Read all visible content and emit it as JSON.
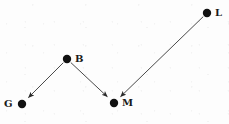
{
  "diagram": {
    "type": "directed-graph",
    "title": "",
    "canvas": {
      "width": 229,
      "height": 124
    },
    "colors": {
      "background": "#fdfdfd",
      "node_fill": "#111111",
      "edge_stroke": "#4a4a4a",
      "label_color": "#1a1a1a"
    },
    "nodes": [
      {
        "id": "B",
        "label": "B",
        "x": 67,
        "y": 59,
        "r": 4.2,
        "label_x": 75,
        "label_y": 54,
        "label_side": "right"
      },
      {
        "id": "G",
        "label": "G",
        "x": 22,
        "y": 104,
        "r": 4.2,
        "label_x": 4,
        "label_y": 99,
        "label_side": "left"
      },
      {
        "id": "M",
        "label": "M",
        "x": 114,
        "y": 103,
        "r": 4.2,
        "label_x": 122,
        "label_y": 98,
        "label_side": "right"
      },
      {
        "id": "L",
        "label": "L",
        "x": 207,
        "y": 13,
        "r": 4.2,
        "label_x": 215,
        "label_y": 8,
        "label_side": "right"
      }
    ],
    "edges": [
      {
        "id": "edge-b-g",
        "from": "B",
        "to": "G",
        "directed": true,
        "arrowhead": "filled-triangle"
      },
      {
        "id": "edge-b-m",
        "from": "B",
        "to": "M",
        "directed": true,
        "arrowhead": "filled-triangle"
      },
      {
        "id": "edge-l-m",
        "from": "L",
        "to": "M",
        "directed": true,
        "arrowhead": "filled-triangle"
      }
    ]
  }
}
